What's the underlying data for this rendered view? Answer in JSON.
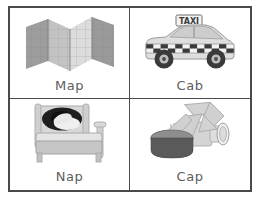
{
  "sheet": {
    "title": "Rhyming Word Picture Cards",
    "background_color": "#ffffff",
    "frame_color": "#4a4a4a",
    "label_color": "#5d5d5d",
    "columns": 2,
    "rows": 2
  },
  "cards": [
    {
      "id": "map",
      "label": "Map",
      "icon": "folded-map-icon",
      "position": "top-left",
      "art_description": "accordion-folded paper map with grid lines",
      "colors": {
        "panel_dark": "#9a9a9a",
        "panel_mid": "#b4b4b4",
        "panel_light": "#d6d6d6",
        "grid_line": "#8c8c8c"
      }
    },
    {
      "id": "cab",
      "label": "Cab",
      "icon": "taxi-cab-icon",
      "position": "top-right",
      "art_description": "taxi car with roof sign and checkered stripe",
      "sign_text": "TAXI",
      "colors": {
        "body": "#dcdcdc",
        "body_shade": "#c2c2c2",
        "window": "#cfcfcf",
        "checker_dark": "#3b3b3b",
        "checker_light": "#f2f2f2",
        "tire": "#3a3a3a",
        "hub": "#bdbdbd"
      }
    },
    {
      "id": "nap",
      "label": "Nap",
      "icon": "bed-sleeping-icon",
      "position": "bottom-left",
      "art_description": "bed with headboard and person sleeping with dark hair on pillow",
      "colors": {
        "frame": "#d2d2d2",
        "frame_shade": "#bcbcbc",
        "blanket": "#c8c8c8",
        "pillow": "#ededed",
        "hair": "#1c1c1c",
        "face": "#e8e8e8"
      }
    },
    {
      "id": "cap",
      "label": "Cap",
      "icon": "bottle-cap-arrow-icon",
      "position": "bottom-right",
      "art_description": "bottle lying on side with cap removed in foreground and arrow pointing at the cap",
      "colors": {
        "cap_top": "#8e8e8e",
        "cap_side": "#585858",
        "bottle": "#d9d9d9",
        "bottle_shade": "#bfbfbf",
        "arrow": "#cfcfcf",
        "arrow_edge": "#b0b0b0"
      }
    }
  ]
}
